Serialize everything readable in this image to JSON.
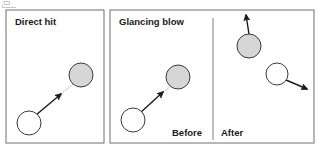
{
  "figure": {
    "width": 321,
    "height": 153,
    "background": "#ffffff"
  },
  "colors": {
    "panel_border": "#6e6e6e",
    "ball_fill_gray": "#d6d6d6",
    "ball_fill_white": "#ffffff",
    "ball_stroke": "#3a3a3a",
    "vector": "#1a1a1a",
    "trajectory_dotted": "#9a9a9a",
    "divider": "#7d7d7d",
    "text": "#1a1a1a"
  },
  "panels": [
    {
      "id": "direct-hit",
      "title": "Direct hit",
      "box": {
        "x": 6,
        "y": 10,
        "w": 98,
        "h": 133
      },
      "title_pos": {
        "x": 15,
        "y": 25
      },
      "balls": [
        {
          "name": "target-ball-gray",
          "kind": "gray",
          "cx": 81,
          "cy": 75,
          "r": 12
        },
        {
          "name": "cue-ball-white",
          "kind": "white",
          "cx": 29,
          "cy": 123,
          "r": 12
        }
      ],
      "vectors": [
        {
          "name": "cue-ball-velocity",
          "x1": 36,
          "y1": 115,
          "x2": 61,
          "y2": 94
        }
      ],
      "trajectories": [
        {
          "name": "impact-path-dotted",
          "x1": 61,
          "y1": 94,
          "x2": 73,
          "y2": 84
        }
      ]
    },
    {
      "id": "glancing-blow",
      "title": "Glancing blow",
      "box": {
        "x": 110,
        "y": 10,
        "w": 204,
        "h": 133
      },
      "title_pos": {
        "x": 119,
        "y": 25
      },
      "divider": {
        "x": 213,
        "y1": 18,
        "y2": 140
      },
      "phase_labels": [
        {
          "name": "before-label",
          "text": "Before",
          "x": 172,
          "y": 136
        },
        {
          "name": "after-label",
          "text": "After",
          "x": 221,
          "y": 136
        }
      ],
      "balls": [
        {
          "name": "before-target-ball-gray",
          "kind": "gray",
          "cx": 178,
          "cy": 77,
          "r": 12
        },
        {
          "name": "before-cue-ball-white",
          "kind": "white",
          "cx": 133,
          "cy": 120,
          "r": 12
        },
        {
          "name": "after-target-ball-gray",
          "cx": 249,
          "cy": 46,
          "r": 12,
          "kind": "gray"
        },
        {
          "name": "after-cue-ball-white",
          "cx": 277,
          "cy": 74,
          "r": 11,
          "kind": "white"
        }
      ],
      "vectors": [
        {
          "name": "before-cue-ball-velocity",
          "x1": 140,
          "y1": 113,
          "x2": 163,
          "y2": 92
        },
        {
          "name": "after-target-ball-velocity",
          "x1": 249,
          "y1": 34,
          "x2": 246,
          "y2": 15
        },
        {
          "name": "after-cue-ball-velocity",
          "x1": 286,
          "y1": 80,
          "x2": 307,
          "y2": 89
        }
      ],
      "trajectories": [
        {
          "name": "before-impact-path-dotted",
          "x1": 163,
          "y1": 92,
          "x2": 171,
          "y2": 86
        }
      ]
    }
  ]
}
